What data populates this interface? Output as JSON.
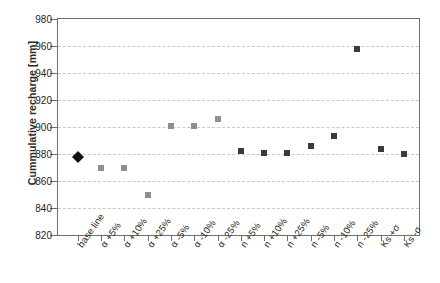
{
  "chart_data": {
    "type": "scatter",
    "title": "",
    "xlabel": "",
    "ylabel": "Cummulative recharge [mm]",
    "ylim": [
      820,
      980
    ],
    "yticks": [
      820,
      840,
      860,
      880,
      900,
      920,
      940,
      960,
      980
    ],
    "ytick_labels": [
      "820",
      "840",
      "860",
      "880",
      "900",
      "920",
      "940",
      "960",
      "980"
    ],
    "grid": "horizontal-dashed",
    "legend": "none",
    "categories": [
      "base line",
      "α +5%",
      "α +10%",
      "α +25%",
      "α -5%",
      "α -10%",
      "α -25%",
      "n +5%",
      "n +10%",
      "n +25%",
      "n -5%",
      "n -10%",
      "n -25%",
      "Ks +σ",
      "Ks -σ"
    ],
    "values": [
      882,
      870,
      870,
      850,
      901,
      901,
      906,
      882,
      881,
      881,
      886,
      893,
      958,
      884,
      880
    ],
    "markers": [
      "diamond-black",
      "square-gray",
      "square-gray",
      "square-gray",
      "square-gray",
      "square-gray",
      "square-gray",
      "square-dark",
      "square-dark",
      "square-dark",
      "square-dark",
      "square-dark",
      "square-dark",
      "square-dark",
      "square-dark"
    ],
    "colors": {
      "baseline_marker": "#111111",
      "alpha_marker": "#8f8f8f",
      "n_marker": "#3a3a3a",
      "gridline": "#c9c9c9",
      "axis": "#6e6e6e",
      "text": "#1f1f1f"
    }
  }
}
